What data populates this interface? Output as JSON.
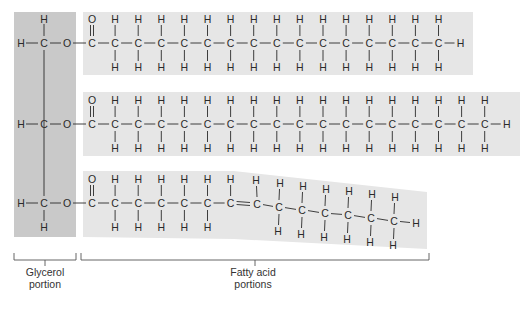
{
  "colors": {
    "glycerol_box": "#c9c9c9",
    "fatty_acid_box": "#e6e6e6",
    "ink": "#2a2a2a",
    "bracket": "#555555"
  },
  "glycerol": {
    "atoms": [
      "H",
      "C",
      "O"
    ],
    "label_line1": "Glycerol",
    "label_line2": "portion"
  },
  "fatty_acids": {
    "label_line1": "Fatty acid",
    "label_line2": "portions",
    "chains": [
      {
        "name": "saturated-chain-1",
        "carbons": 16,
        "double_bond_after": null
      },
      {
        "name": "saturated-chain-2",
        "carbons": 18,
        "double_bond_after": null
      },
      {
        "name": "unsaturated-chain-3",
        "carbons": 14,
        "double_bond_after": 7
      }
    ]
  },
  "atom_symbols": {
    "carbon": "C",
    "hydrogen": "H",
    "oxygen": "O"
  }
}
